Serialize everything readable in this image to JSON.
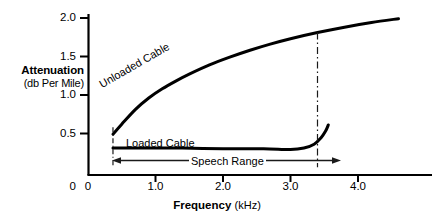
{
  "chart_data": {
    "type": "line",
    "title": "",
    "xlabel": "Frequency",
    "xunit": "(kHz)",
    "ylabel": "Attenuation",
    "yunit": "(db Per Mile)",
    "xlim": [
      0,
      4.6
    ],
    "ylim": [
      0,
      2.15
    ],
    "xticks": [
      "0",
      "1.0",
      "2.0",
      "3.0",
      "4.0"
    ],
    "xtick_values": [
      0,
      1.0,
      2.0,
      3.0,
      4.0
    ],
    "yticks": [
      "0",
      "0.5",
      "1.0",
      "1.5",
      "2.0"
    ],
    "ytick_values": [
      0,
      0.5,
      1.0,
      1.5,
      2.0
    ],
    "grid": false,
    "legend_position": "inline-annotation",
    "series": [
      {
        "name": "Unloaded Cable",
        "label": "Unloaded Cable",
        "x": [
          0.37,
          0.5,
          0.7,
          0.9,
          1.1,
          1.3,
          1.5,
          1.8,
          2.1,
          2.4,
          2.7,
          3.0,
          3.4,
          3.8,
          4.2,
          4.6
        ],
        "y": [
          0.53,
          0.66,
          0.85,
          1.0,
          1.12,
          1.22,
          1.31,
          1.43,
          1.53,
          1.62,
          1.7,
          1.77,
          1.85,
          1.92,
          1.98,
          2.03
        ]
      },
      {
        "name": "Loaded Cable",
        "label": "Loaded Cable",
        "x": [
          0.37,
          0.8,
          1.4,
          2.0,
          2.6,
          3.0,
          3.2,
          3.35,
          3.45,
          3.52,
          3.56
        ],
        "y": [
          0.35,
          0.35,
          0.35,
          0.34,
          0.34,
          0.33,
          0.35,
          0.4,
          0.48,
          0.57,
          0.65
        ]
      }
    ],
    "annotations": [
      {
        "name": "speech-range",
        "label": "Speech Range",
        "type": "double-arrow",
        "x_start": 0.37,
        "x_end": 3.4,
        "y": 0.2
      },
      {
        "name": "lower-cutoff-marker",
        "type": "dash-dot-vertical",
        "x": 0.37,
        "y_bottom": 0.1,
        "y_top": 0.62
      },
      {
        "name": "upper-cutoff-marker",
        "type": "dash-dot-vertical",
        "x": 3.4,
        "y_bottom": 0.1,
        "y_top": 1.85
      }
    ]
  },
  "axis": {
    "y_title_main": "Attenuation",
    "y_title_sub": "(db Per Mile)",
    "x_title_main": "Frequency",
    "x_title_sub": "(kHz)"
  },
  "colors": {
    "line": "#000000",
    "axis": "#000000",
    "background": "#ffffff",
    "annotation": "#1a1a1a"
  }
}
